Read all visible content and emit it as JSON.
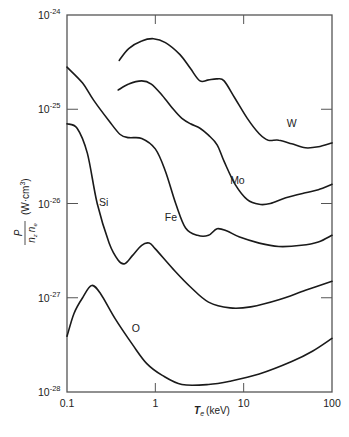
{
  "chart_data": {
    "type": "line",
    "title": "",
    "xlabel": "T_e (keV)",
    "ylabel": "P/(n_z n_e) (W·cm³)",
    "xscale": "log",
    "yscale": "log",
    "xlim": [
      0.1,
      100
    ],
    "ylim": [
      1e-28,
      1e-24
    ],
    "grid": false,
    "legend": "inline labels",
    "x_ticks": [
      {
        "value": 0.1,
        "label": "0.1"
      },
      {
        "value": 1,
        "label": "1"
      },
      {
        "value": 10,
        "label": "10"
      },
      {
        "value": 100,
        "label": "100"
      }
    ],
    "y_ticks": [
      {
        "value": 1e-24,
        "base": "10",
        "exp": "-24"
      },
      {
        "value": 1e-25,
        "base": "10",
        "exp": "-25"
      },
      {
        "value": 1e-26,
        "base": "10",
        "exp": "-26"
      },
      {
        "value": 1e-27,
        "base": "10",
        "exp": "-27"
      },
      {
        "value": 1e-28,
        "base": "10",
        "exp": "-28"
      }
    ],
    "series": [
      {
        "name": "W",
        "label_pos": {
          "x": 35,
          "y": 6.5e-26
        },
        "points": [
          [
            0.39,
            3.3e-25
          ],
          [
            0.5,
            4.4e-25
          ],
          [
            0.7,
            5.3e-25
          ],
          [
            0.95,
            5.6e-25
          ],
          [
            1.3,
            5.1e-25
          ],
          [
            1.9,
            3.8e-25
          ],
          [
            2.5,
            2.7e-25
          ],
          [
            3.2,
            2e-25
          ],
          [
            4.0,
            2.05e-25
          ],
          [
            5.0,
            2.1e-25
          ],
          [
            6.0,
            2e-25
          ],
          [
            8.0,
            1.3e-25
          ],
          [
            11,
            8e-26
          ],
          [
            15,
            5.5e-26
          ],
          [
            19,
            4.7e-26
          ],
          [
            25,
            4.7e-26
          ],
          [
            35,
            4.3e-26
          ],
          [
            50,
            3.9e-26
          ],
          [
            70,
            4e-26
          ],
          [
            100,
            4.4e-26
          ]
        ]
      },
      {
        "name": "Mo",
        "label_pos": {
          "x": 8.5,
          "y": 1.6e-26
        },
        "points": [
          [
            0.38,
            1.6e-25
          ],
          [
            0.5,
            1.85e-25
          ],
          [
            0.7,
            2e-25
          ],
          [
            0.9,
            1.85e-25
          ],
          [
            1.2,
            1.4e-25
          ],
          [
            1.6,
            1e-25
          ],
          [
            2.0,
            8e-26
          ],
          [
            2.5,
            7e-26
          ],
          [
            3.2,
            6.3e-26
          ],
          [
            4.0,
            5.3e-26
          ],
          [
            5.0,
            4.2e-26
          ],
          [
            6.0,
            2.8e-26
          ],
          [
            8.0,
            1.6e-26
          ],
          [
            11,
            1.1e-26
          ],
          [
            15,
            9.8e-27
          ],
          [
            20,
            1e-26
          ],
          [
            30,
            1.15e-26
          ],
          [
            50,
            1.3e-26
          ],
          [
            70,
            1.4e-26
          ],
          [
            100,
            1.6e-26
          ]
        ]
      },
      {
        "name": "Fe",
        "label_pos": {
          "x": 1.5,
          "y": 6.5e-27
        },
        "points": [
          [
            0.1,
            2.8e-25
          ],
          [
            0.15,
            1.9e-25
          ],
          [
            0.2,
            1.25e-25
          ],
          [
            0.3,
            7.5e-26
          ],
          [
            0.4,
            5.4e-26
          ],
          [
            0.5,
            5e-26
          ],
          [
            0.7,
            4.9e-26
          ],
          [
            1.0,
            3.8e-26
          ],
          [
            1.3,
            2.2e-26
          ],
          [
            1.7,
            1e-26
          ],
          [
            2.2,
            5.5e-27
          ],
          [
            3.0,
            4.6e-27
          ],
          [
            4.0,
            4.6e-27
          ],
          [
            5.0,
            5.4e-27
          ],
          [
            6.5,
            5.1e-27
          ],
          [
            9.0,
            4.4e-27
          ],
          [
            15,
            3.8e-27
          ],
          [
            25,
            3.5e-27
          ],
          [
            45,
            3.6e-27
          ],
          [
            70,
            3.9e-27
          ],
          [
            100,
            4.6e-27
          ]
        ]
      },
      {
        "name": "Si",
        "label_pos": {
          "x": 0.26,
          "y": 9.5e-27
        },
        "points": [
          [
            0.1,
            7e-26
          ],
          [
            0.13,
            6.3e-26
          ],
          [
            0.17,
            3.4e-26
          ],
          [
            0.22,
            1e-26
          ],
          [
            0.3,
            3.8e-27
          ],
          [
            0.38,
            2.5e-27
          ],
          [
            0.45,
            2.3e-27
          ],
          [
            0.55,
            2.8e-27
          ],
          [
            0.7,
            3.6e-27
          ],
          [
            0.85,
            3.8e-27
          ],
          [
            1.0,
            3.3e-27
          ],
          [
            1.6,
            2e-27
          ],
          [
            2.5,
            1.3e-27
          ],
          [
            4.0,
            9e-28
          ],
          [
            7.0,
            7.8e-28
          ],
          [
            12,
            8e-28
          ],
          [
            25,
            9.5e-28
          ],
          [
            50,
            1.2e-27
          ],
          [
            100,
            1.5e-27
          ]
        ]
      },
      {
        "name": "O",
        "label_pos": {
          "x": 0.6,
          "y": 4.3e-28
        },
        "points": [
          [
            0.1,
            3.9e-28
          ],
          [
            0.12,
            6.8e-28
          ],
          [
            0.15,
            1e-27
          ],
          [
            0.19,
            1.35e-27
          ],
          [
            0.24,
            1.1e-27
          ],
          [
            0.35,
            6e-28
          ],
          [
            0.55,
            3.2e-28
          ],
          [
            0.8,
            2e-28
          ],
          [
            1.2,
            1.5e-28
          ],
          [
            2.0,
            1.2e-28
          ],
          [
            4.0,
            1.2e-28
          ],
          [
            7.0,
            1.3e-28
          ],
          [
            15,
            1.55e-28
          ],
          [
            35,
            2.1e-28
          ],
          [
            60,
            2.7e-28
          ],
          [
            100,
            3.7e-28
          ]
        ]
      }
    ]
  },
  "axes": {
    "x_title_var": "T",
    "x_title_sub": "e",
    "x_title_unit": "(keV)",
    "y_title_num": "P",
    "y_title_den_a": "n",
    "y_title_den_a_sub": "z",
    "y_title_den_b": "n",
    "y_title_den_b_sub": "e",
    "y_title_unit": "(W·cm",
    "y_title_unit_exp": "3",
    "y_title_unit_close": ")"
  },
  "colors": {
    "line": "#1a1a1a",
    "frame": "#555555",
    "background": "#ffffff"
  }
}
